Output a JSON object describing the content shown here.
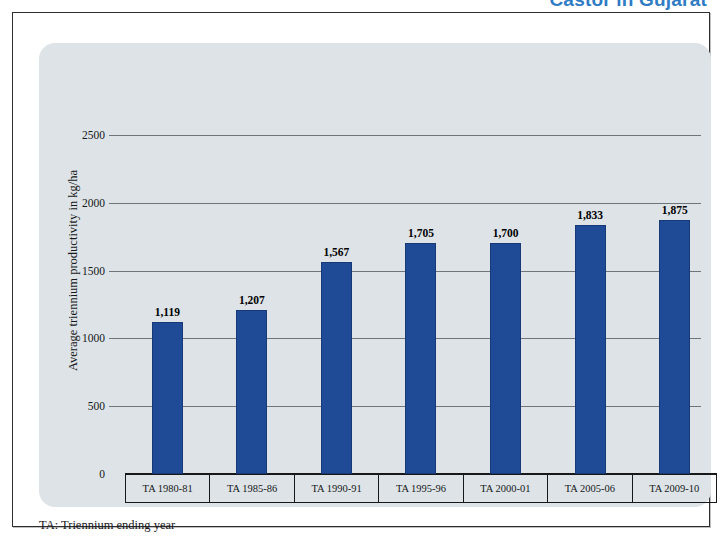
{
  "document": {
    "title": "Castor in Gujarat",
    "title_color": "#2f7cc4"
  },
  "footnote": "TA: Triennium ending year",
  "chart_data": {
    "type": "bar",
    "title": "Castor in Gujarat",
    "xlabel": "",
    "ylabel": "Average triennium productivity in kg/ha",
    "categories": [
      "TA 1980-81",
      "TA 1985-86",
      "TA 1990-91",
      "TA 1995-96",
      "TA 2000-01",
      "TA 2005-06",
      "TA 2009-10"
    ],
    "values": [
      1119,
      1207,
      1567,
      1705,
      1700,
      1833,
      1875
    ],
    "value_labels": [
      "1,119",
      "1,207",
      "1,567",
      "1,705",
      "1,700",
      "1,833",
      "1,875"
    ],
    "ylim": [
      0,
      2500
    ],
    "yticks": [
      0,
      500,
      1000,
      1500,
      2000,
      2500
    ],
    "ytick_labels": [
      "0",
      "500",
      "1000",
      "1500",
      "2000",
      "2500"
    ],
    "grid": true,
    "legend": false,
    "bar_color": "#1f4b96",
    "plot_background": "#dde3e6",
    "gridline_color": "#6f7679"
  }
}
